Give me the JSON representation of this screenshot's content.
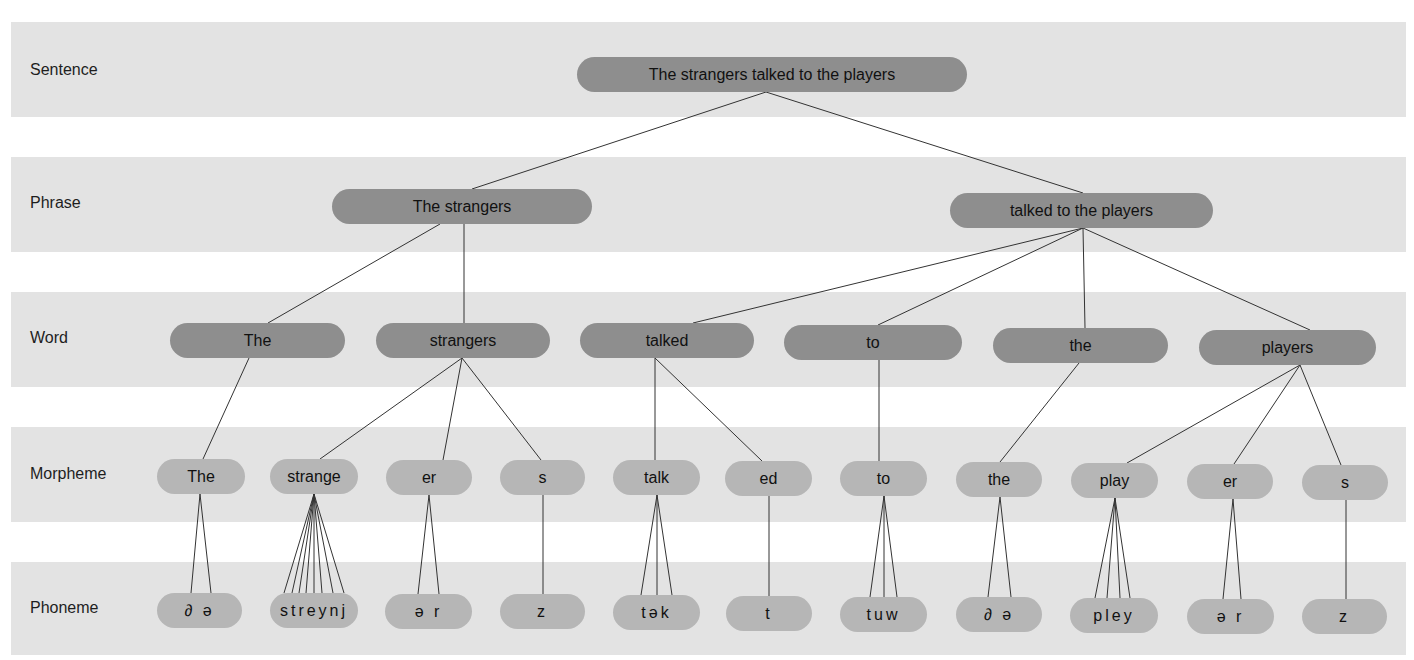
{
  "levels": [
    {
      "key": "sentence",
      "label": "Sentence",
      "band": [
        22,
        117
      ],
      "label_y": 70
    },
    {
      "key": "phrase",
      "label": "Phrase",
      "band": [
        157,
        252
      ],
      "label_y": 203
    },
    {
      "key": "word",
      "label": "Word",
      "band": [
        292,
        387
      ],
      "label_y": 338
    },
    {
      "key": "morpheme",
      "label": "Morpheme",
      "band": [
        427,
        522
      ],
      "label_y": 474
    },
    {
      "key": "phoneme",
      "label": "Phoneme",
      "band": [
        562,
        655
      ],
      "label_y": 608
    }
  ],
  "colors": {
    "band": "#e3e3e3",
    "pill_dark": "#8e8e8e",
    "pill_light": "#b6b6b6",
    "line": "#333333"
  },
  "sentence": [
    {
      "text": "The strangers talked to the players",
      "x": 577,
      "y": 57,
      "w": 390,
      "h": 35
    }
  ],
  "phrases": [
    {
      "text": "The strangers",
      "x": 332,
      "y": 189,
      "w": 260,
      "h": 35
    },
    {
      "text": "talked to the players",
      "x": 950,
      "y": 193,
      "w": 263,
      "h": 35
    }
  ],
  "words": [
    {
      "text": "The",
      "x": 170,
      "y": 323,
      "w": 175,
      "h": 35
    },
    {
      "text": "strangers",
      "x": 376,
      "y": 323,
      "w": 174,
      "h": 35
    },
    {
      "text": "talked",
      "x": 580,
      "y": 323,
      "w": 174,
      "h": 35
    },
    {
      "text": "to",
      "x": 784,
      "y": 325,
      "w": 178,
      "h": 35
    },
    {
      "text": "the",
      "x": 993,
      "y": 328,
      "w": 175,
      "h": 35
    },
    {
      "text": "players",
      "x": 1199,
      "y": 330,
      "w": 177,
      "h": 35
    }
  ],
  "morphemes": [
    {
      "text": "The",
      "x": 157,
      "y": 459,
      "w": 88,
      "h": 35
    },
    {
      "text": "strange",
      "x": 270,
      "y": 459,
      "w": 88,
      "h": 35
    },
    {
      "text": "er",
      "x": 386,
      "y": 460,
      "w": 86,
      "h": 35
    },
    {
      "text": "s",
      "x": 500,
      "y": 460,
      "w": 85,
      "h": 35
    },
    {
      "text": "talk",
      "x": 613,
      "y": 460,
      "w": 87,
      "h": 35
    },
    {
      "text": "ed",
      "x": 725,
      "y": 461,
      "w": 87,
      "h": 35
    },
    {
      "text": "to",
      "x": 840,
      "y": 461,
      "w": 87,
      "h": 35
    },
    {
      "text": "the",
      "x": 956,
      "y": 462,
      "w": 86,
      "h": 35
    },
    {
      "text": "play",
      "x": 1071,
      "y": 463,
      "w": 87,
      "h": 35
    },
    {
      "text": "er",
      "x": 1187,
      "y": 464,
      "w": 86,
      "h": 35
    },
    {
      "text": "s",
      "x": 1302,
      "y": 465,
      "w": 86,
      "h": 35
    }
  ],
  "phonemes": [
    {
      "text": "∂ ə",
      "x": 157,
      "y": 593,
      "w": 85,
      "h": 35
    },
    {
      "text": "streynj",
      "x": 270,
      "y": 593,
      "w": 88,
      "h": 35
    },
    {
      "text": "ə r",
      "x": 385,
      "y": 594,
      "w": 87,
      "h": 35
    },
    {
      "text": "z",
      "x": 500,
      "y": 594,
      "w": 85,
      "h": 35
    },
    {
      "text": "tək",
      "x": 613,
      "y": 595,
      "w": 87,
      "h": 35
    },
    {
      "text": "t",
      "x": 726,
      "y": 596,
      "w": 86,
      "h": 35
    },
    {
      "text": "tuw",
      "x": 840,
      "y": 597,
      "w": 87,
      "h": 35
    },
    {
      "text": "∂ ə",
      "x": 956,
      "y": 597,
      "w": 86,
      "h": 35
    },
    {
      "text": "pley",
      "x": 1070,
      "y": 598,
      "w": 88,
      "h": 35
    },
    {
      "text": "ə r",
      "x": 1187,
      "y": 599,
      "w": 87,
      "h": 35
    },
    {
      "text": "z",
      "x": 1302,
      "y": 599,
      "w": 85,
      "h": 35
    }
  ],
  "links": [
    [
      766,
      92,
      472,
      189
    ],
    [
      766,
      92,
      1083,
      193
    ],
    [
      440,
      224,
      268,
      323
    ],
    [
      464,
      224,
      464,
      323
    ],
    [
      1083,
      228,
      693,
      323
    ],
    [
      1083,
      228,
      878,
      325
    ],
    [
      1083,
      228,
      1085,
      328
    ],
    [
      1083,
      228,
      1310,
      330
    ],
    [
      249,
      358,
      203,
      459
    ],
    [
      462,
      358,
      320,
      459
    ],
    [
      462,
      358,
      443,
      460
    ],
    [
      462,
      358,
      541,
      460
    ],
    [
      655,
      358,
      655,
      460
    ],
    [
      655,
      358,
      762,
      461
    ],
    [
      879,
      360,
      879,
      461
    ],
    [
      1079,
      363,
      1000,
      462
    ],
    [
      1300,
      365,
      1127,
      463
    ],
    [
      1300,
      365,
      1234,
      464
    ],
    [
      1300,
      365,
      1341,
      465
    ],
    [
      200,
      494,
      191,
      593
    ],
    [
      200,
      494,
      211,
      593
    ],
    [
      314,
      494,
      284,
      593
    ],
    [
      314,
      494,
      292,
      593
    ],
    [
      314,
      494,
      299,
      593
    ],
    [
      314,
      494,
      306,
      593
    ],
    [
      314,
      494,
      314,
      593
    ],
    [
      314,
      494,
      322,
      593
    ],
    [
      314,
      494,
      333,
      593
    ],
    [
      314,
      494,
      344,
      593
    ],
    [
      429,
      495,
      418,
      594
    ],
    [
      429,
      495,
      439,
      594
    ],
    [
      543,
      495,
      543,
      594
    ],
    [
      657,
      495,
      641,
      595
    ],
    [
      657,
      495,
      657,
      595
    ],
    [
      657,
      495,
      672,
      595
    ],
    [
      769,
      496,
      769,
      596
    ],
    [
      884,
      496,
      870,
      597
    ],
    [
      884,
      496,
      884,
      597
    ],
    [
      884,
      496,
      897,
      597
    ],
    [
      1000,
      497,
      988,
      597
    ],
    [
      1000,
      497,
      1011,
      597
    ],
    [
      1115,
      498,
      1095,
      598
    ],
    [
      1115,
      498,
      1107,
      598
    ],
    [
      1115,
      498,
      1120,
      598
    ],
    [
      1115,
      498,
      1130,
      598
    ],
    [
      1233,
      499,
      1223,
      599
    ],
    [
      1233,
      499,
      1241,
      599
    ],
    [
      1346,
      500,
      1346,
      599
    ]
  ]
}
